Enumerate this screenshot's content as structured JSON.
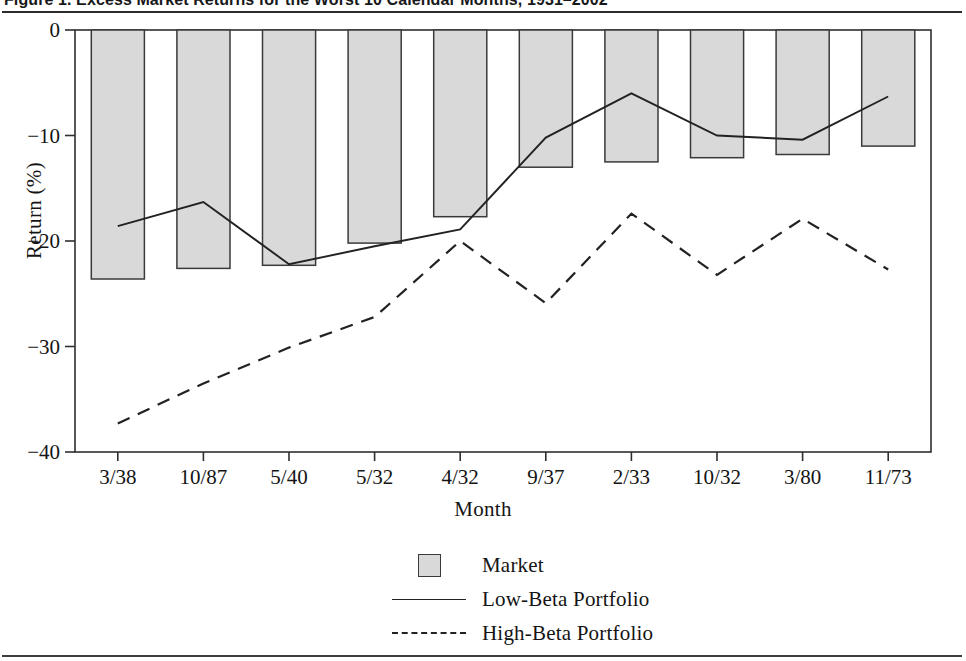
{
  "figure": {
    "title": "Figure 1.  Excess Market Returns for the Worst 10 Calendar Months, 1931–2002",
    "title_visible_fragment": "Figure 1.  Excess Market Returns for the Worst 10 Calendar Months, 1931-2002"
  },
  "legend": {
    "position": "bottom-center",
    "items": [
      {
        "key": "swatch",
        "label": "Market",
        "swatch_color": "#d9d9d9"
      },
      {
        "key": "solid-line",
        "label": "Low-Beta Portfolio",
        "swatch_color": "#222222"
      },
      {
        "key": "dashed-line",
        "label": "High-Beta Portfolio",
        "swatch_color": "#222222"
      }
    ]
  },
  "axes": {
    "y_tick_labels": [
      "0",
      "−10",
      "−20",
      "−30",
      "−40"
    ],
    "y_tick_values": [
      0,
      -10,
      -20,
      -30,
      -40
    ],
    "x_tick_labels": [
      "3/38",
      "10/87",
      "5/40",
      "5/32",
      "4/32",
      "9/37",
      "2/33",
      "10/32",
      "3/80",
      "11/73"
    ]
  },
  "chart_data": {
    "type": "bar",
    "xlabel": "Month",
    "ylabel": "Return (%)",
    "categories": [
      "3/38",
      "10/87",
      "5/40",
      "5/32",
      "4/32",
      "9/37",
      "2/33",
      "10/32",
      "3/80",
      "11/73"
    ],
    "ylim": [
      -40,
      0
    ],
    "xlim_note": "categorical, 10 months ordered worst-to-least-worst",
    "grid": false,
    "legend_position": "bottom-center",
    "series": [
      {
        "name": "Market",
        "render": "bar",
        "fill": "#d9d9d9",
        "stroke": "#3a3a3a",
        "values": [
          -23.6,
          -22.6,
          -22.3,
          -20.2,
          -17.7,
          -13.0,
          -12.5,
          -12.1,
          -11.8,
          -11.0
        ]
      },
      {
        "name": "Low-Beta Portfolio",
        "render": "line-solid",
        "stroke": "#222222",
        "values": [
          -18.6,
          -16.3,
          -22.2,
          -20.5,
          -18.9,
          -10.2,
          -6.0,
          -10.0,
          -10.4,
          -6.3
        ]
      },
      {
        "name": "High-Beta Portfolio",
        "render": "line-dashed",
        "stroke": "#222222",
        "values": [
          -37.3,
          -33.5,
          -30.1,
          -27.2,
          -20.0,
          -25.9,
          -17.4,
          -23.2,
          -17.9,
          -22.7
        ]
      }
    ]
  }
}
